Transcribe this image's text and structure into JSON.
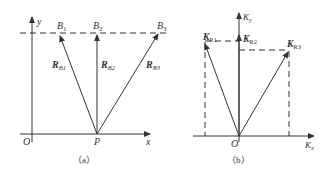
{
  "figure_a": {
    "caption": "（a）",
    "axis_x": "x",
    "axis_y": "y",
    "origin": "O",
    "point_p": "P",
    "points": [
      {
        "name": "B",
        "sub": "1"
      },
      {
        "name": "B",
        "sub": "2"
      },
      {
        "name": "B",
        "sub": "3"
      }
    ],
    "vectors": [
      {
        "name": "R",
        "sub": "B1"
      },
      {
        "name": "R",
        "sub": "B2"
      },
      {
        "name": "R",
        "sub": "B3"
      }
    ]
  },
  "figure_b": {
    "caption": "（b）",
    "axis_x": {
      "name": "K",
      "sub": "x"
    },
    "axis_y": {
      "name": "K",
      "sub": "y"
    },
    "origin": "O",
    "vectors": [
      {
        "name": "K",
        "sub": "R1"
      },
      {
        "name": "K",
        "sub": "R2"
      },
      {
        "name": "K",
        "sub": "R3"
      }
    ]
  },
  "colors": {
    "line": "#333333",
    "background": "#ffffff"
  }
}
